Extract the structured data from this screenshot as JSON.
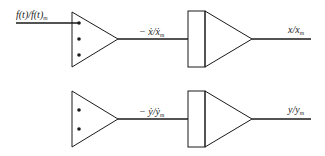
{
  "diagram": {
    "title": "",
    "stroke_color": "#1a1a1a",
    "rows": [
      {
        "id": "x-channel",
        "input_label": "f(t)/f(t)",
        "input_label_sub": "m",
        "summer_inputs": 3,
        "summer_output_label": "− ẋ/ẋ",
        "summer_output_sub": "m",
        "integrator_output_label": "x/x",
        "integrator_output_sub": "m"
      },
      {
        "id": "y-channel",
        "input_label": "",
        "summer_inputs": 2,
        "summer_output_label": "− ẏ/ẏ",
        "summer_output_sub": "m",
        "integrator_output_label": "y/y",
        "integrator_output_sub": "m"
      }
    ],
    "blocks": {
      "summer": "summing amplifier (triangle)",
      "integrator": "integrator (rectangle + triangle)"
    }
  }
}
